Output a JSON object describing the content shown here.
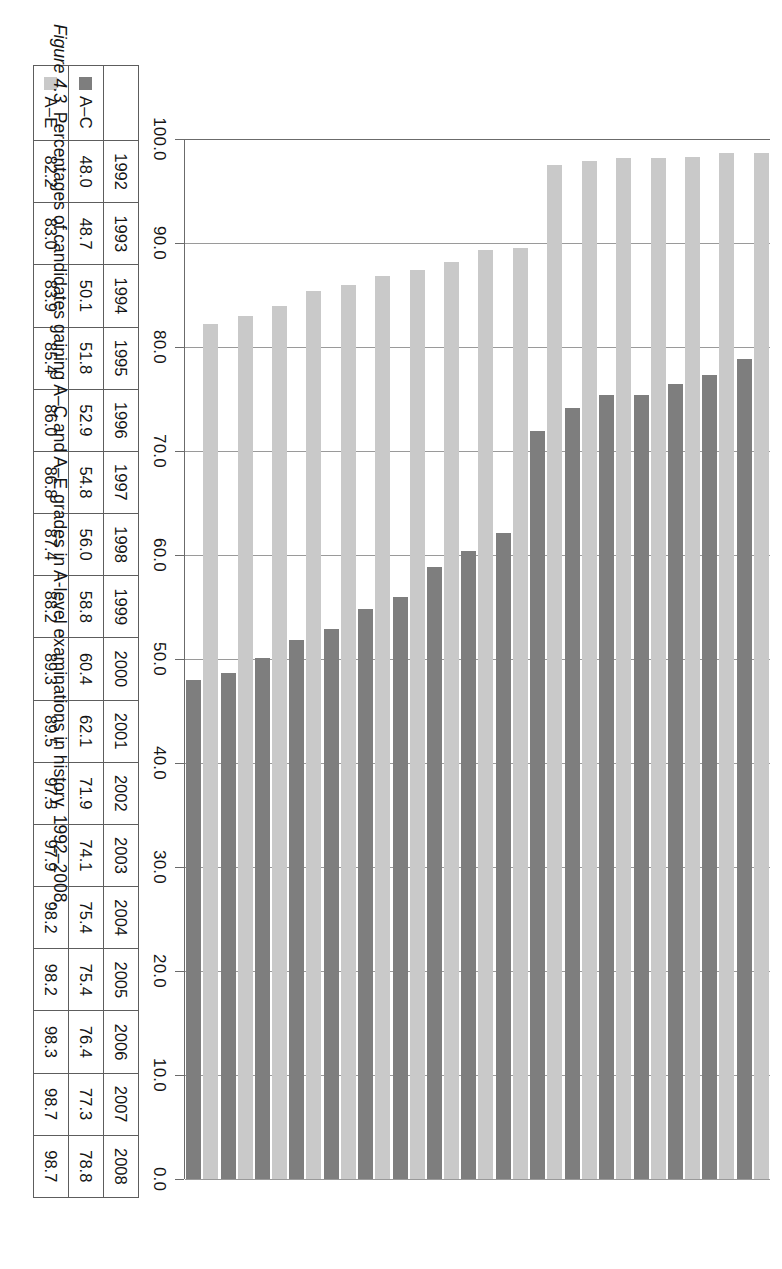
{
  "figure": {
    "number": "Figure 4.3",
    "caption": "Percentages of candidates gaining A–C and A–E grades in A-level examinations in history, 1992–2008."
  },
  "legend": {
    "series_ac_label": "A–C",
    "series_ae_label": "A–E",
    "color_ac": "#7e7e7e",
    "color_ae": "#c9c9c9"
  },
  "axis": {
    "tick_labels": [
      "100.0",
      "90.0",
      "80.0",
      "70.0",
      "60.0",
      "50.0",
      "40.0",
      "30.0",
      "20.0",
      "10.0",
      "0.0"
    ]
  },
  "table": {
    "row_label_ac": "A–C",
    "row_label_ae": "A–E",
    "years": [
      "1992",
      "1993",
      "1994",
      "1995",
      "1996",
      "1997",
      "1998",
      "1999",
      "2000",
      "2001",
      "2002",
      "2003",
      "2004",
      "2005",
      "2006",
      "2007",
      "2008"
    ],
    "ac_text": [
      "48.0",
      "48.7",
      "50.1",
      "51.8",
      "52.9",
      "54.8",
      "56.0",
      "58.8",
      "60.4",
      "62.1",
      "71.9",
      "74.1",
      "75.4",
      "75.4",
      "76.4",
      "77.3",
      "78.8"
    ],
    "ae_text": [
      "82.2",
      "83.0",
      "83.9",
      "85.4",
      "86.0",
      "86.8",
      "87.4",
      "88.2",
      "89.3",
      "89.5",
      "97.5",
      "97.9",
      "98.2",
      "98.2",
      "98.3",
      "98.7",
      "98.7"
    ]
  },
  "chart_data": {
    "type": "bar",
    "orientation": "horizontal",
    "title": "Percentages of candidates gaining A–C and A–E grades in A-level examinations in history, 1992–2008.",
    "xlabel": "",
    "ylabel": "",
    "categories": [
      "1992",
      "1993",
      "1994",
      "1995",
      "1996",
      "1997",
      "1998",
      "1999",
      "2000",
      "2001",
      "2002",
      "2003",
      "2004",
      "2005",
      "2006",
      "2007",
      "2008"
    ],
    "series": [
      {
        "name": "A–C",
        "color": "#7e7e7e",
        "values": [
          48.0,
          48.7,
          50.1,
          51.8,
          52.9,
          54.8,
          56.0,
          58.8,
          60.4,
          62.1,
          71.9,
          74.1,
          75.4,
          75.4,
          76.4,
          77.3,
          78.8
        ]
      },
      {
        "name": "A–E",
        "color": "#c9c9c9",
        "values": [
          82.2,
          83.0,
          83.9,
          85.4,
          86.0,
          86.8,
          87.4,
          88.2,
          89.3,
          89.5,
          97.5,
          97.9,
          98.2,
          98.2,
          98.3,
          98.7,
          98.7
        ]
      }
    ],
    "value_axis": {
      "ticks": [
        100.0,
        90.0,
        80.0,
        70.0,
        60.0,
        50.0,
        40.0,
        30.0,
        20.0,
        10.0,
        0.0
      ],
      "min": 0.0,
      "max": 100.0,
      "reversed": true
    },
    "grid": true,
    "legend_position": "table-row-headers"
  }
}
